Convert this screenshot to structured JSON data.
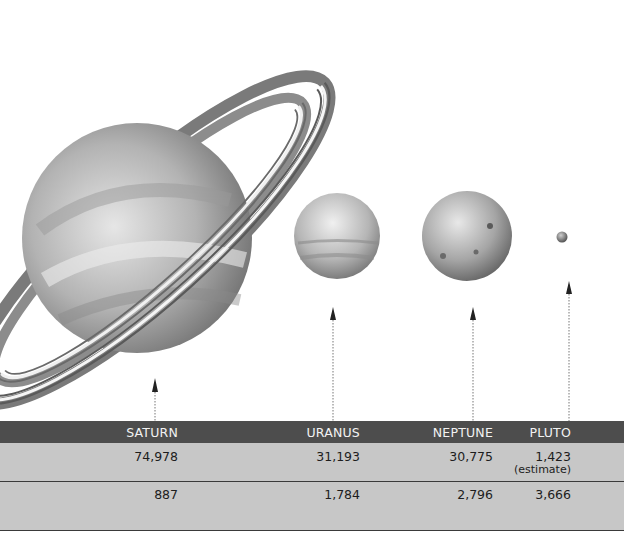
{
  "planets": [
    {
      "name": "Saturn",
      "icon": "saturn-illustration"
    },
    {
      "name": "Uranus",
      "icon": "uranus-illustration"
    },
    {
      "name": "Neptune",
      "icon": "neptune-illustration"
    },
    {
      "name": "Pluto",
      "icon": "pluto-illustration"
    }
  ],
  "table": {
    "headers": [
      "SATURN",
      "URANUS",
      "NEPTUNE",
      "PLUTO"
    ],
    "row1": [
      "74,978",
      "31,193",
      "30,775",
      "1,423"
    ],
    "row1_note": "(estimate)",
    "row2": [
      "887",
      "1,784",
      "2,796",
      "3,666"
    ]
  },
  "colors": {
    "header_bg": "#4d4d4d",
    "row_bg": "#c7c7c7",
    "header_text": "#f2f2f2"
  }
}
